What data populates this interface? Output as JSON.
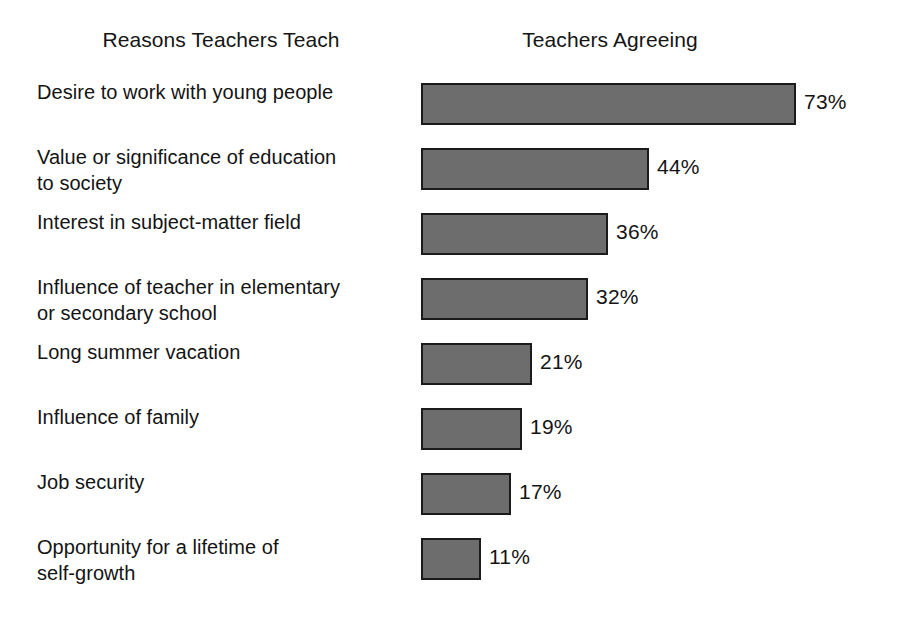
{
  "headers": {
    "left": "Reasons Teachers Teach",
    "right": "Teachers Agreeing"
  },
  "chart_data": {
    "type": "bar",
    "orientation": "horizontal",
    "title": "",
    "xlabel": "",
    "ylabel": "",
    "xlim": [
      0,
      80
    ],
    "grid": false,
    "legend": null,
    "column_headers": [
      "Reasons Teachers Teach",
      "Teachers Agreeing"
    ],
    "value_suffix": "%",
    "bar_color": "#6d6d6d",
    "bar_border_color": "#1b1b1b",
    "categories": [
      "Desire to work with young people",
      "Value or significance of education to society",
      "Interest in subject-matter field",
      "Influence of teacher in elementary or secondary school",
      "Long summer vacation",
      "Influence of family",
      "Job security",
      "Opportunity for a lifetime of self-growth"
    ],
    "values": [
      73,
      44,
      36,
      32,
      21,
      19,
      17,
      11
    ],
    "value_labels": [
      "73%",
      "44%",
      "36%",
      "32%",
      "21%",
      "19%",
      "17%",
      "11%"
    ]
  },
  "rows": [
    {
      "lines": [
        "Desire to work with young people"
      ],
      "value": 73,
      "value_label": "73%",
      "top": 79
    },
    {
      "lines": [
        "Value or significance of education",
        "to society"
      ],
      "value": 44,
      "value_label": "44%",
      "top": 144
    },
    {
      "lines": [
        "Interest in subject-matter field"
      ],
      "value": 36,
      "value_label": "36%",
      "top": 209
    },
    {
      "lines": [
        "Influence of teacher in elementary",
        "or secondary school"
      ],
      "value": 32,
      "value_label": "32%",
      "top": 274
    },
    {
      "lines": [
        "Long summer vacation"
      ],
      "value": 21,
      "value_label": "21%",
      "top": 339
    },
    {
      "lines": [
        "Influence of family"
      ],
      "value": 19,
      "value_label": "19%",
      "top": 404
    },
    {
      "lines": [
        "Job security"
      ],
      "value": 17,
      "value_label": "17%",
      "top": 469
    },
    {
      "lines": [
        "Opportunity for a lifetime of",
        "self-growth"
      ],
      "value": 11,
      "value_label": "11%",
      "top": 534
    }
  ],
  "scale": {
    "pixels_per_percent": 5.08,
    "value_label_gap": 8
  }
}
